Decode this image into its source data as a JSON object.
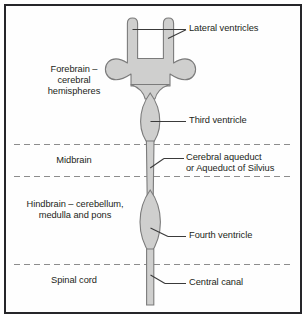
{
  "figure": {
    "background_color": "#fefefe",
    "border_color": "#26262a",
    "ventricle_fill": "#cfcfce",
    "ventricle_stroke": "#7b7b7b",
    "divider_color": "#8c8c8c",
    "leader_color": "#3a3a3a",
    "text_color": "#231f20"
  },
  "regions": [
    {
      "id": "forebrain",
      "label": "Forebrain –\ncerebral\nhemispheres"
    },
    {
      "id": "midbrain",
      "label": "Midbrain"
    },
    {
      "id": "hindbrain",
      "label": "Hindbrain – cerebellum,\nmedulla and pons"
    },
    {
      "id": "spinal_cord",
      "label": "Spinal cord"
    }
  ],
  "callouts": [
    {
      "id": "lateral_ventricles",
      "label": "Lateral ventricles"
    },
    {
      "id": "third_ventricle",
      "label": "Third ventricle"
    },
    {
      "id": "cerebral_aqueduct",
      "label": "Cerebral aqueduct\nor Aqueduct of Silvius"
    },
    {
      "id": "fourth_ventricle",
      "label": "Fourth ventricle"
    },
    {
      "id": "central_canal",
      "label": "Central canal"
    }
  ],
  "dividers": [
    {
      "id": "forebrain_midbrain",
      "y": 144
    },
    {
      "id": "midbrain_hindbrain",
      "y": 176
    },
    {
      "id": "hindbrain_spinal",
      "y": 264
    }
  ]
}
